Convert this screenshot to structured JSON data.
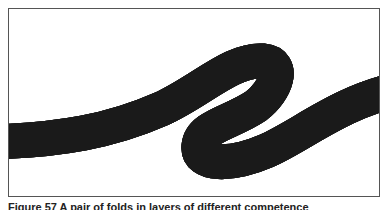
{
  "figure": {
    "caption": "Figure 57  A pair of folds in layers of different competence"
  },
  "colors": {
    "line": "#1a1a1a",
    "stipple": "#9a9a9a",
    "background": "#ffffff",
    "frame": "#555555"
  }
}
